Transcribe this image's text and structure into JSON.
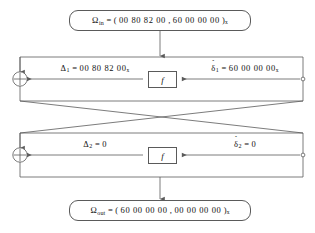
{
  "diagram": {
    "colors": {
      "line": "#5a5a5a",
      "text": "#111111",
      "background": "#ffffff"
    },
    "input_box": {
      "symbol": "Ω",
      "subscript": "in",
      "equals": " = ( ",
      "left_half": "00 80 82 00",
      "separator": " ,  ",
      "right_half": "60 00 00 00",
      "close": " )",
      "base_subscript": "x",
      "full_text": "Ω in = ( 00 80 82 00 ,  60 00 00 00 )x"
    },
    "output_box": {
      "symbol": "Ω",
      "subscript": "out",
      "equals": " = ( ",
      "left_half": "60 00 00 00",
      "separator": " ,  ",
      "right_half": "00 00 00 00",
      "close": " )",
      "base_subscript": "x",
      "full_text": "Ω out = ( 60 00 00 00 ,  00 00 00 00 )x"
    },
    "rounds": [
      {
        "index": "1",
        "f_label": "f",
        "delta": {
          "symbol": "Δ",
          "subscript": "1",
          "equals": " = ",
          "value": "00 80 82 00",
          "base_subscript": "x",
          "full_text": "Δ1 = 00 80 82 00x"
        },
        "little_delta": {
          "symbol": "δ",
          "accent": "hat",
          "subscript": "1",
          "equals": " = ",
          "value": "60 00 00 00",
          "base_subscript": "x",
          "full_text": "δ1 = 60 00 00 00x"
        }
      },
      {
        "index": "2",
        "f_label": "f",
        "delta": {
          "symbol": "Δ",
          "subscript": "2",
          "equals": " = ",
          "value": "0",
          "base_subscript": "",
          "full_text": "Δ2 = 0"
        },
        "little_delta": {
          "symbol": "δ",
          "accent": "hat",
          "subscript": "2",
          "equals": " = ",
          "value": "0",
          "base_subscript": "",
          "full_text": "δ2 = 0"
        }
      }
    ],
    "xor_nodes": [
      {
        "name": "xor-round-1",
        "glyph": "⊕"
      },
      {
        "name": "xor-round-2",
        "glyph": "⊕"
      }
    ],
    "tap_nodes": [
      {
        "name": "tap-round-1"
      },
      {
        "name": "tap-round-2"
      }
    ]
  }
}
